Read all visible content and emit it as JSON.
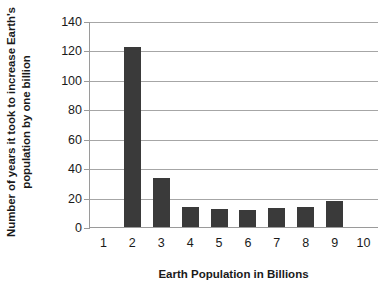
{
  "chart_data": {
    "type": "bar",
    "title": "",
    "xlabel": "Earth Population in Billions",
    "ylabel_line1": "Number of years it took to increase Earth's",
    "ylabel_line2": "population by one billion",
    "ylabel": "Number of years it took to increase Earth's population by one billion",
    "categories": [
      "1",
      "2",
      "3",
      "4",
      "5",
      "6",
      "7",
      "8",
      "9",
      "10"
    ],
    "values": [
      null,
      123,
      34,
      14,
      13,
      12.5,
      13.5,
      14,
      18.5,
      null
    ],
    "ylim": [
      0,
      140
    ],
    "yticks": [
      0,
      20,
      40,
      60,
      80,
      100,
      120,
      140
    ],
    "ytick_labels": [
      "0",
      "20",
      "40",
      "60",
      "80",
      "100",
      "120",
      "140"
    ],
    "grid": true,
    "grid_axis": "y",
    "legend": false,
    "bar_color": "#3a3a3a",
    "axis_color": "#9a9a9a",
    "grid_color": "#a6a6a6",
    "background": "#ffffff"
  }
}
